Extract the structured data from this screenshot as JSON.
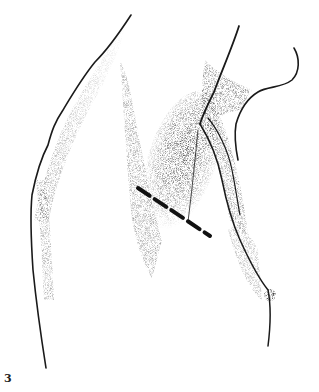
{
  "figure": {
    "number": "3",
    "style": "stipple",
    "colors": {
      "ink": "#1a1a1a",
      "background": "#ffffff"
    },
    "annotations": [
      {
        "type": "dashed-incision-line",
        "from": [
          138,
          188
        ],
        "to": [
          210,
          236
        ]
      }
    ]
  }
}
